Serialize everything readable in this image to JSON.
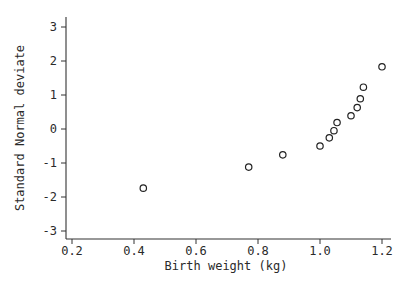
{
  "chart_data": {
    "type": "scatter",
    "title": "",
    "xlabel": "Birth weight (kg)",
    "ylabel": "Standard Normal deviate",
    "xlim": [
      0.17,
      1.23
    ],
    "ylim": [
      -3.3,
      3.35
    ],
    "xticks": [
      0.2,
      0.4,
      0.6,
      0.8,
      1.0,
      1.2
    ],
    "xtick_labels": [
      "0.2",
      "0.4",
      "0.6",
      "0.8",
      "1.0",
      "1.2"
    ],
    "yticks": [
      -3,
      -2,
      -1,
      0,
      1,
      2,
      3
    ],
    "ytick_labels": [
      "-3",
      "-2",
      "-1",
      "0",
      "1",
      "2",
      "3"
    ],
    "grid": false,
    "legend": null,
    "marker": "open-circle",
    "series": [
      {
        "name": "observations",
        "x": [
          0.43,
          0.77,
          0.88,
          1.0,
          1.03,
          1.045,
          1.055,
          1.1,
          1.12,
          1.13,
          1.14,
          1.2
        ],
        "y": [
          -1.74,
          -1.12,
          -0.76,
          -0.5,
          -0.26,
          -0.05,
          0.19,
          0.39,
          0.63,
          0.89,
          1.23,
          1.83
        ]
      }
    ]
  }
}
